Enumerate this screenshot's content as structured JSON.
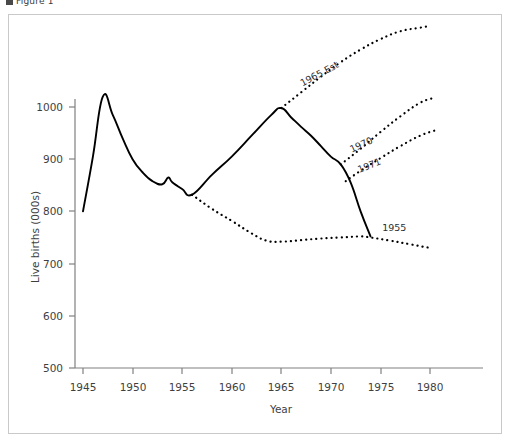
{
  "figure": {
    "caption": "Figure 1",
    "caption_icon": "document-icon"
  },
  "chart_data": {
    "type": "line",
    "title": "",
    "xlabel": "Year",
    "ylabel": "Live births (000s)",
    "xlim": [
      1945,
      1981
    ],
    "ylim": [
      500,
      1050
    ],
    "xticks": [
      1945,
      1950,
      1955,
      1960,
      1965,
      1970,
      1975,
      1980
    ],
    "yticks": [
      500,
      600,
      700,
      800,
      900,
      1000
    ],
    "grid": false,
    "legend": "inline-annotations",
    "series": [
      {
        "name": "Actual",
        "style": "solid",
        "label": "",
        "x": [
          1945,
          1946,
          1947,
          1948,
          1949,
          1950,
          1951,
          1952,
          1953,
          1953.6,
          1954,
          1955,
          1956,
          1958,
          1960,
          1962,
          1964,
          1965,
          1966,
          1967,
          1968,
          1969,
          1970,
          1971,
          1972,
          1973,
          1974
        ],
        "values": [
          800,
          905,
          1020,
          985,
          940,
          900,
          875,
          858,
          852,
          865,
          856,
          843,
          832,
          870,
          905,
          945,
          985,
          998,
          980,
          962,
          945,
          925,
          905,
          890,
          855,
          800,
          752
        ]
      },
      {
        "name": "1965 Est",
        "style": "dotted",
        "label": "1965 Est",
        "x": [
          1965,
          1967,
          1969,
          1971,
          1973,
          1975,
          1977,
          1979,
          1980
        ],
        "values": [
          998,
          1028,
          1058,
          1086,
          1110,
          1130,
          1145,
          1152,
          1155
        ]
      },
      {
        "name": "1970",
        "style": "dotted",
        "label": "1970",
        "x": [
          1971,
          1973,
          1975,
          1977,
          1979,
          1980.5
        ],
        "values": [
          890,
          920,
          952,
          982,
          1008,
          1018
        ]
      },
      {
        "name": "1971",
        "style": "dotted",
        "label": "1971",
        "x": [
          1971.5,
          1973,
          1975,
          1977,
          1979,
          1980.5
        ],
        "values": [
          858,
          878,
          902,
          925,
          945,
          955
        ]
      },
      {
        "name": "1955",
        "style": "dotted",
        "label": "1955",
        "x": [
          1956,
          1958,
          1960,
          1962,
          1963.5,
          1965,
          1967,
          1969,
          1971,
          1973,
          1974,
          1976,
          1978,
          1980
        ],
        "values": [
          832,
          805,
          782,
          758,
          744,
          742,
          745,
          748,
          750,
          752,
          750,
          744,
          737,
          730
        ]
      }
    ],
    "annotations": [
      {
        "text": "1965 Est",
        "x": 1969.0,
        "y": 1058,
        "rotation": -28
      },
      {
        "text": "1970",
        "x": 1973.2,
        "y": 922,
        "rotation": -25
      },
      {
        "text": "1971",
        "x": 1974.0,
        "y": 882,
        "rotation": -22
      },
      {
        "text": "1955",
        "x": 1976.4,
        "y": 762,
        "rotation": 0
      }
    ]
  },
  "colors": {
    "line": "#000000",
    "axis": "#808080",
    "frame": "#c9c9c9",
    "text": "#3f3f3f",
    "background": "#ffffff"
  }
}
